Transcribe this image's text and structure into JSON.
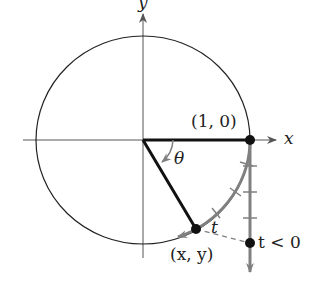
{
  "diagram": {
    "type": "unit-circle-wrapping-function",
    "axis_labels": {
      "x": "x",
      "y": "y"
    },
    "point_labels": {
      "start": "(1, 0)",
      "end": "(x, y)",
      "negative_param": "t < 0"
    },
    "angle_label": "θ",
    "arc_label": "t",
    "colors": {
      "ink": "#222222",
      "gray": "#808080",
      "background": "#ffffff"
    }
  }
}
